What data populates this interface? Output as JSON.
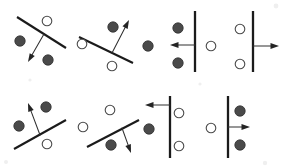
{
  "figure": {
    "width": 284,
    "height": 168,
    "background_color": "#ffffff",
    "rows": 2,
    "columns": 4,
    "panel_count": 8,
    "legend": {
      "filled_circle_label": "class A (filled circle)",
      "open_circle_label": "class B (open circle)",
      "line_label": "decision boundary",
      "arrow_label": "normal vector"
    },
    "colors": {
      "line": "#1b1b1b",
      "arrow": "#242424",
      "filled_point": "#4a4a4a",
      "open_point_stroke": "#4a4a4a",
      "open_point_fill": "#ffffff",
      "background": "#ffffff"
    }
  },
  "chart_data": {
    "type": "scatter",
    "xlabel": "",
    "ylabel": "",
    "grid": false,
    "legend_position": "none",
    "xlim": [
      0,
      284
    ],
    "ylim": [
      0,
      168
    ],
    "panels": [
      {
        "id": "panel-1",
        "row": 1,
        "column": 1,
        "boundary": {
          "orientation": "diagonal-down",
          "x1": 17,
          "y1": 17,
          "x2": 66,
          "y2": 48,
          "stroke_width": 2.1
        },
        "vector": {
          "direction": "down-left",
          "x1": 44,
          "y1": 34,
          "x2": 28,
          "y2": 62
        },
        "points": [
          {
            "type": "filled",
            "cx": 20,
            "cy": 41,
            "r": 5.2
          },
          {
            "type": "filled",
            "cx": 48,
            "cy": 60,
            "r": 5.2
          },
          {
            "type": "open",
            "cx": 47,
            "cy": 21,
            "r": 4.8
          }
        ]
      },
      {
        "id": "panel-2",
        "row": 1,
        "column": 2,
        "boundary": {
          "orientation": "diagonal-down",
          "x1": 79,
          "y1": 37,
          "x2": 133,
          "y2": 63,
          "stroke_width": 2.1
        },
        "vector": {
          "direction": "up-right",
          "x1": 112,
          "y1": 53,
          "x2": 129,
          "y2": 20
        },
        "points": [
          {
            "type": "filled",
            "cx": 113,
            "cy": 27,
            "r": 5.2
          },
          {
            "type": "open",
            "cx": 82,
            "cy": 44,
            "r": 4.8
          },
          {
            "type": "open",
            "cx": 112,
            "cy": 66,
            "r": 4.8
          }
        ]
      },
      {
        "id": "panel-3",
        "row": 1,
        "column": 3,
        "boundary": {
          "orientation": "vertical",
          "x1": 195,
          "y1": 11,
          "x2": 195,
          "y2": 72,
          "stroke_width": 2.3
        },
        "vector": {
          "direction": "left",
          "x1": 195,
          "y1": 45,
          "x2": 170,
          "y2": 45
        },
        "points": [
          {
            "type": "filled",
            "cx": 148,
            "cy": 46,
            "r": 5.2
          },
          {
            "type": "filled",
            "cx": 178,
            "cy": 28,
            "r": 5.2
          },
          {
            "type": "filled",
            "cx": 178,
            "cy": 63,
            "r": 5.2
          }
        ]
      },
      {
        "id": "panel-4",
        "row": 1,
        "column": 4,
        "boundary": {
          "orientation": "vertical",
          "x1": 253,
          "y1": 11,
          "x2": 253,
          "y2": 72,
          "stroke_width": 2.3
        },
        "vector": {
          "direction": "right",
          "x1": 253,
          "y1": 46,
          "x2": 279,
          "y2": 46
        },
        "points": [
          {
            "type": "open",
            "cx": 211,
            "cy": 46,
            "r": 4.8
          },
          {
            "type": "open",
            "cx": 240,
            "cy": 29,
            "r": 4.8
          },
          {
            "type": "open",
            "cx": 240,
            "cy": 64,
            "r": 4.8
          }
        ]
      },
      {
        "id": "panel-5",
        "row": 2,
        "column": 1,
        "boundary": {
          "orientation": "diagonal-up",
          "x1": 14,
          "y1": 149,
          "x2": 66,
          "y2": 120,
          "stroke_width": 2.1
        },
        "vector": {
          "direction": "up-left",
          "x1": 40,
          "y1": 135,
          "x2": 28,
          "y2": 103
        },
        "points": [
          {
            "type": "filled",
            "cx": 46,
            "cy": 107,
            "r": 5.2
          },
          {
            "type": "filled",
            "cx": 19,
            "cy": 126,
            "r": 5.2
          },
          {
            "type": "open",
            "cx": 47,
            "cy": 144,
            "r": 4.8
          }
        ]
      },
      {
        "id": "panel-6",
        "row": 2,
        "column": 2,
        "boundary": {
          "orientation": "diagonal-up",
          "x1": 87,
          "y1": 147,
          "x2": 139,
          "y2": 120,
          "stroke_width": 2.1
        },
        "vector": {
          "direction": "down-right",
          "x1": 122,
          "y1": 128,
          "x2": 131,
          "y2": 153
        },
        "points": [
          {
            "type": "open",
            "cx": 110,
            "cy": 110,
            "r": 4.8
          },
          {
            "type": "open",
            "cx": 83,
            "cy": 127,
            "r": 4.8
          },
          {
            "type": "filled",
            "cx": 111,
            "cy": 145,
            "r": 5.2
          }
        ]
      },
      {
        "id": "panel-7",
        "row": 2,
        "column": 3,
        "boundary": {
          "orientation": "vertical",
          "x1": 170,
          "y1": 96,
          "x2": 170,
          "y2": 158,
          "stroke_width": 2.3
        },
        "vector": {
          "direction": "left",
          "x1": 170,
          "y1": 105,
          "x2": 145,
          "y2": 105
        },
        "points": [
          {
            "type": "filled",
            "cx": 149,
            "cy": 129,
            "r": 5.2
          },
          {
            "type": "open",
            "cx": 179,
            "cy": 113,
            "r": 4.8
          },
          {
            "type": "open",
            "cx": 179,
            "cy": 146,
            "r": 4.8
          }
        ]
      },
      {
        "id": "panel-8",
        "row": 2,
        "column": 4,
        "boundary": {
          "orientation": "vertical",
          "x1": 228,
          "y1": 96,
          "x2": 228,
          "y2": 158,
          "stroke_width": 2.3
        },
        "vector": {
          "direction": "right",
          "x1": 228,
          "y1": 127,
          "x2": 250,
          "y2": 127
        },
        "points": [
          {
            "type": "open",
            "cx": 211,
            "cy": 128,
            "r": 4.8
          },
          {
            "type": "filled",
            "cx": 240,
            "cy": 111,
            "r": 5.2
          },
          {
            "type": "filled",
            "cx": 240,
            "cy": 145,
            "r": 5.2
          }
        ]
      }
    ],
    "specks": [
      {
        "cx": 276,
        "cy": 6,
        "r": 2.4
      },
      {
        "cx": 6,
        "cy": 162,
        "r": 2.0
      },
      {
        "cx": 265,
        "cy": 163,
        "r": 2.2
      },
      {
        "cx": 30,
        "cy": 80,
        "r": 1.6
      },
      {
        "cx": 200,
        "cy": 84,
        "r": 1.6
      }
    ]
  }
}
